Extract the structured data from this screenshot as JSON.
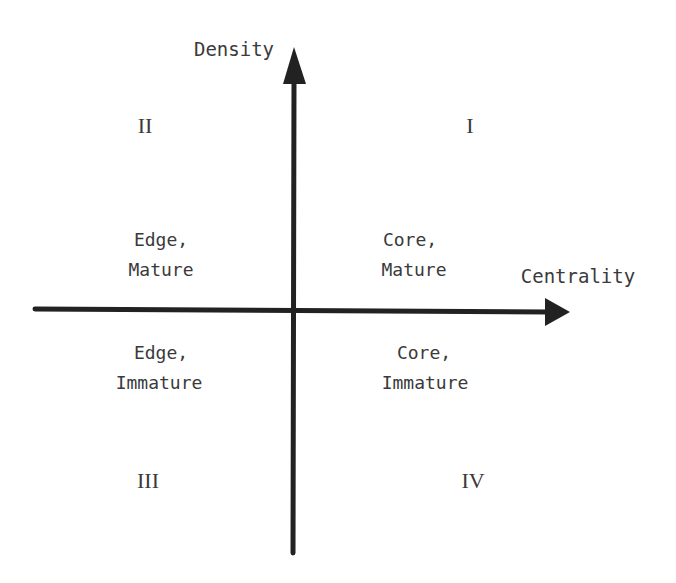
{
  "diagram": {
    "type": "quadrant",
    "axes": {
      "y_label": "Density",
      "x_label": "Centrality",
      "line_color": "#222222"
    },
    "quadrants": [
      {
        "numeral": "I",
        "line1": "Core,",
        "line2": "Mature"
      },
      {
        "numeral": "II",
        "line1": "Edge,",
        "line2": "Mature"
      },
      {
        "numeral": "III",
        "line1": "Edge,",
        "line2": "Immature"
      },
      {
        "numeral": "IV",
        "line1": "Core,",
        "line2": "Immature"
      }
    ]
  }
}
